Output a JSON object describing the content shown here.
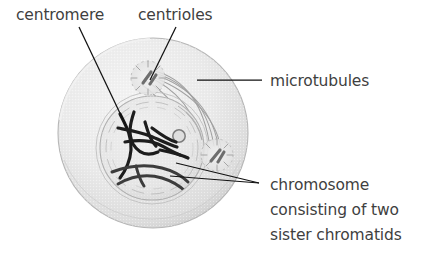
{
  "figure": {
    "background_color": "#ffffff",
    "text_color": "#3f3f3f",
    "leader_line_color": "#1a1a1a",
    "cell_fill_color": "#e9e9e9",
    "cell_edge_color": "#b3b3b3",
    "chromosome_color": "#1d1d1d",
    "spindle_color": "#9a9a9a"
  },
  "labels": {
    "centromere": "centromere",
    "centrioles": "centrioles",
    "microtubules": "microtubules",
    "chromosome_line1": "chromosome",
    "chromosome_line2": "consisting of two",
    "chromosome_line3": "sister chromatids"
  },
  "structures": {
    "cell": "cell-body",
    "nuclear_envelope": "nuclear-envelope",
    "nucleolus": "nucleolus",
    "centriole_top": "centriole-aster-top",
    "centriole_bottom": "centriole-aster-bottom",
    "chromosomes": "chromosome-mass",
    "spindle": "spindle-microtubules"
  }
}
